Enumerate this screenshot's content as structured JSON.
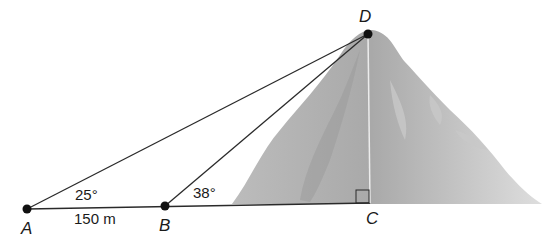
{
  "diagram": {
    "points": {
      "A": {
        "label": "A",
        "x": 27,
        "y": 209
      },
      "B": {
        "label": "B",
        "x": 165,
        "y": 206
      },
      "C": {
        "label": "C",
        "x": 370,
        "y": 203
      },
      "D": {
        "label": "D",
        "x": 368,
        "y": 34
      }
    },
    "angle_A": "25°",
    "angle_B": "38°",
    "distance_AB": "150 m",
    "right_angle_at": "C",
    "colors": {
      "line": "#2a2a2a",
      "mountain_light": "#d4d4d4",
      "mountain_dark": "#a8a8a8"
    }
  }
}
